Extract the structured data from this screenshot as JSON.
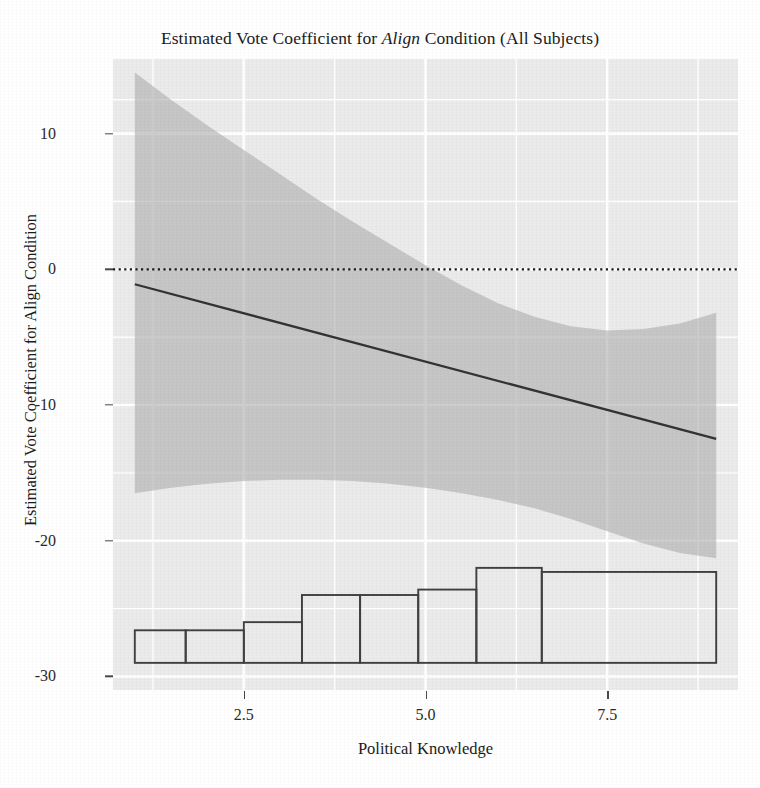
{
  "chart_data": {
    "type": "line",
    "title": "Estimated Vote Coefficient for Align Condition (All Subjects)",
    "title_plain_before": "Estimated Vote Coefficient for ",
    "title_italic": "Align",
    "title_plain_after": " Condition (All Subjects)",
    "xlabel": "Political Knowledge",
    "ylabel": "Estimated Vote Coefficient for Align Condition",
    "xlim": [
      0.7,
      9.3
    ],
    "ylim": [
      -31.0,
      15.5
    ],
    "xticks": [
      2.5,
      5.0,
      7.5
    ],
    "xtick_labels": [
      "2.5",
      "5.0",
      "7.5"
    ],
    "yticks": [
      10,
      0,
      -10,
      -20,
      -30
    ],
    "ytick_labels": [
      "10",
      "0",
      "-10",
      "-20",
      "-30"
    ],
    "grid": "major and minor white gridlines on gray panel",
    "legend": "none",
    "panel_background": "#ebebeb",
    "gridline_color": "#ffffff",
    "ribbon_color": "#b0b0b0",
    "line_color": "#333333",
    "zero_line_color": "#1a1a1a",
    "histogram_outline_color": "#404040",
    "series": [
      {
        "name": "Fitted marginal effect",
        "type": "line",
        "x": [
          1.0,
          9.0
        ],
        "y": [
          -1.1,
          -12.5
        ]
      },
      {
        "name": "95% confidence band",
        "type": "ribbon",
        "x": [
          1.0,
          1.5,
          2.0,
          2.5,
          3.0,
          3.5,
          4.0,
          4.5,
          5.0,
          5.5,
          6.0,
          6.5,
          7.0,
          7.5,
          8.0,
          8.5,
          9.0
        ],
        "ymax": [
          14.5,
          12.5,
          10.6,
          8.8,
          7.0,
          5.2,
          3.5,
          1.9,
          0.3,
          -1.2,
          -2.5,
          -3.5,
          -4.2,
          -4.5,
          -4.4,
          -4.0,
          -3.2
        ],
        "ymin": [
          -16.5,
          -16.1,
          -15.8,
          -15.6,
          -15.5,
          -15.5,
          -15.6,
          -15.8,
          -16.1,
          -16.5,
          -17.0,
          -17.6,
          -18.4,
          -19.3,
          -20.2,
          -20.9,
          -21.3
        ]
      },
      {
        "name": "Zero reference line",
        "type": "hline",
        "y": 0,
        "style": "dotted"
      },
      {
        "name": "Political Knowledge distribution",
        "type": "histogram",
        "baseline": -29.0,
        "bin_edges": [
          1.0,
          1.7,
          2.5,
          3.3,
          4.1,
          4.9,
          5.7,
          6.6,
          7.6,
          9.0
        ],
        "bins": [
          {
            "x0": 1.0,
            "x1": 1.7,
            "top": -26.6
          },
          {
            "x0": 1.7,
            "x1": 2.5,
            "top": -26.6
          },
          {
            "x0": 2.5,
            "x1": 3.3,
            "top": -26.0
          },
          {
            "x0": 3.3,
            "x1": 4.1,
            "top": -24.0
          },
          {
            "x0": 4.1,
            "x1": 4.9,
            "top": -24.0
          },
          {
            "x0": 4.9,
            "x1": 5.7,
            "top": -23.6
          },
          {
            "x0": 5.7,
            "x1": 6.6,
            "top": -22.0
          },
          {
            "x0": 6.6,
            "x1": 9.0,
            "top": -22.3
          }
        ]
      }
    ]
  }
}
